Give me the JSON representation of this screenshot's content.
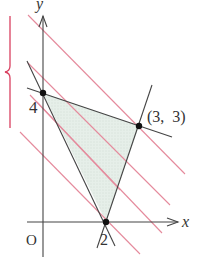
{
  "figure": {
    "type": "linear-programming-region",
    "axis_labels": {
      "x": "x",
      "y": "y",
      "origin": "O"
    },
    "tick_labels": {
      "y_intercept": "4",
      "x_intercept": "2"
    },
    "vertices": [
      {
        "label": "",
        "x": 0,
        "y": 4
      },
      {
        "label": "(3,  3)",
        "x": 3,
        "y": 3
      },
      {
        "label": "",
        "x": 2,
        "y": 0
      }
    ],
    "point_label_33": "(3,  3)",
    "shaded_region": "triangle with vertices (0,4), (3,3), (2,0)",
    "level_lines": {
      "description": "parallel lines x + y = k",
      "count": 5,
      "color": "#e0607a"
    },
    "colors": {
      "axis": "#444444",
      "boundary": "#444444",
      "level_line": "#e0607a",
      "region_fill": "#e4eee8",
      "brace": "#d94060",
      "point": "#111111"
    }
  }
}
